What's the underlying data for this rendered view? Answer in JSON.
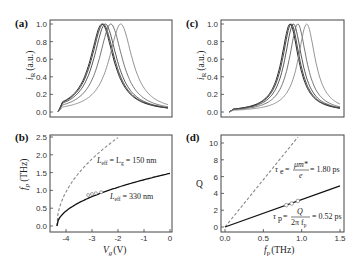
{
  "chart_data": [
    {
      "panel": "(a)",
      "type": "line",
      "title": "",
      "xlabel": "",
      "ylabel": "i_R (a.u.)",
      "ylim": [
        0.0,
        1.0
      ],
      "yticks": [
        "0.0",
        "0.2",
        "0.4",
        "0.6",
        "0.8",
        "1.0"
      ],
      "xticks": [],
      "description": "Normalized resonance curves; five Lorentzian-like peaks, black curves peaking near the left and gray curves shifted right",
      "series": [
        {
          "name": "curve1",
          "peak_x_frac": 0.4,
          "color": "#111111"
        },
        {
          "name": "curve2",
          "peak_x_frac": 0.41,
          "color": "#333333"
        },
        {
          "name": "curve3",
          "peak_x_frac": 0.43,
          "color": "#444444"
        },
        {
          "name": "curve4",
          "peak_x_frac": 0.48,
          "color": "#666666"
        },
        {
          "name": "curve5",
          "peak_x_frac": 0.57,
          "color": "#888888"
        }
      ]
    },
    {
      "panel": "(c)",
      "type": "line",
      "title": "",
      "xlabel": "",
      "ylabel": "i_R (a.u.)",
      "ylim": [
        0.0,
        1.0
      ],
      "yticks": [
        "0.0",
        "0.2",
        "0.4",
        "0.6",
        "0.8",
        "1.0"
      ],
      "xticks": [],
      "description": "Normalized resonance curves with narrower peaks, peaks shifted right",
      "series": [
        {
          "name": "curve1",
          "peak_x_frac": 0.55,
          "color": "#111111"
        },
        {
          "name": "curve2",
          "peak_x_frac": 0.56,
          "color": "#333333"
        },
        {
          "name": "curve3",
          "peak_x_frac": 0.58,
          "color": "#444444"
        },
        {
          "name": "curve4",
          "peak_x_frac": 0.62,
          "color": "#666666"
        },
        {
          "name": "curve5",
          "peak_x_frac": 0.7,
          "color": "#888888"
        }
      ]
    },
    {
      "panel": "(b)",
      "type": "line",
      "title": "",
      "xlabel": "V_g (V)",
      "ylabel": "f_p (THz)",
      "xlim": [
        -4.4,
        0
      ],
      "ylim": [
        0.0,
        2.5
      ],
      "xticks": [
        "-4",
        "-3",
        "-2",
        "-1",
        "0"
      ],
      "yticks": [
        "0.0",
        "0.5",
        "1.0",
        "1.5",
        "2.0",
        "2.5"
      ],
      "series": [
        {
          "name": "L_eff = L_g = 150 nm",
          "style": "dashed",
          "color": "#888888",
          "x": [
            -4.35,
            -4.2,
            -4.0,
            -3.5,
            -3.0,
            -2.5,
            -2.0
          ],
          "y": [
            0.0,
            0.5,
            0.8,
            1.35,
            1.8,
            2.2,
            2.5
          ]
        },
        {
          "name": "L_eff = 330 nm",
          "style": "solid",
          "color": "#111111",
          "x": [
            -4.35,
            -4.2,
            -4.0,
            -3.5,
            -3.0,
            -2.5,
            -2.0,
            -1.0,
            0.0
          ],
          "y": [
            0.0,
            0.3,
            0.5,
            0.72,
            0.88,
            1.0,
            1.1,
            1.3,
            1.48
          ]
        },
        {
          "name": "measured",
          "style": "markers",
          "color": "#666666",
          "x": [
            -3.15,
            -3.0,
            -2.85,
            -2.65
          ],
          "y": [
            0.87,
            0.9,
            0.92,
            0.95
          ]
        }
      ],
      "annotations": [
        "L_eff = L_g = 150 nm",
        "L_eff = 330 nm"
      ]
    },
    {
      "panel": "(d)",
      "type": "line",
      "title": "",
      "xlabel": "f_p (THz)",
      "ylabel": "Q",
      "xlim": [
        0.0,
        1.5
      ],
      "ylim": [
        0,
        10
      ],
      "xticks": [
        "0.0",
        "0.5",
        "1.0",
        "1.5"
      ],
      "yticks": [
        "0",
        "2",
        "4",
        "6",
        "8",
        "10"
      ],
      "series": [
        {
          "name": "tau_e = mu m*/e = 1.80 ps",
          "style": "dashed",
          "color": "#888888",
          "x": [
            0.0,
            0.95
          ],
          "y": [
            0.0,
            10.7
          ]
        },
        {
          "name": "tau_p = Q/(2 pi f_p) = 0.52 ps",
          "style": "solid",
          "color": "#111111",
          "x": [
            0.0,
            1.5
          ],
          "y": [
            0.0,
            4.9
          ]
        },
        {
          "name": "measured",
          "style": "markers",
          "color": "#666666",
          "x": [
            0.8,
            0.87,
            0.95
          ],
          "y": [
            2.6,
            2.8,
            3.1
          ]
        }
      ],
      "annotations": [
        "τe = μm*/e = 1.80 ps",
        "τp = Q/(2π fp) = 0.52 ps"
      ]
    }
  ],
  "labels": {
    "panel_a": "(a)",
    "panel_b": "(b)",
    "panel_c": "(c)",
    "panel_d": "(d)",
    "a_ylabel_main": "i",
    "a_ylabel_sub": "R",
    "a_ylabel_unit": "(a.u.)",
    "c_ylabel_main": "i",
    "c_ylabel_sub": "R",
    "c_ylabel_unit": "(a.u.)",
    "b_ylabel_main": "f",
    "b_ylabel_sub": "p",
    "b_ylabel_unit": "(THz)",
    "b_xlabel_main": "V",
    "b_xlabel_sub": "g",
    "b_xlabel_unit": "(V)",
    "d_ylabel": "Q",
    "d_xlabel_main": "f",
    "d_xlabel_sub": "p",
    "d_xlabel_unit": "(THz)",
    "b_ann1_a": "L",
    "b_ann1_sub": "eff",
    "b_ann1_b": " = L",
    "b_ann1_sub2": "g",
    "b_ann1_c": " = 150 nm",
    "b_ann2_a": "L",
    "b_ann2_sub": "eff",
    "b_ann2_c": " = 330 nm",
    "d_ann1_lhs": "τ",
    "d_ann1_sub": "e",
    "d_ann1_num": "μm*",
    "d_ann1_den": "e",
    "d_ann1_rhs": "= 1.80 ps",
    "d_ann2_lhs": "τ",
    "d_ann2_sub": "p",
    "d_ann2_num": "Q",
    "d_ann2_den": "2π f",
    "d_ann2_den_sub": "p",
    "d_ann2_rhs": "= 0.52 ps",
    "eq": "="
  },
  "ticks": {
    "ac_y": [
      "0.0",
      "0.2",
      "0.4",
      "0.6",
      "0.8",
      "1.0"
    ],
    "b_y": [
      "0.0",
      "0.5",
      "1.0",
      "1.5",
      "2.0",
      "2.5"
    ],
    "b_x": [
      "-4",
      "-3",
      "-2",
      "-1",
      "0"
    ],
    "d_y": [
      "0",
      "2",
      "4",
      "6",
      "8",
      "10"
    ],
    "d_x": [
      "0.0",
      "0.5",
      "1.0",
      "1.5"
    ]
  }
}
